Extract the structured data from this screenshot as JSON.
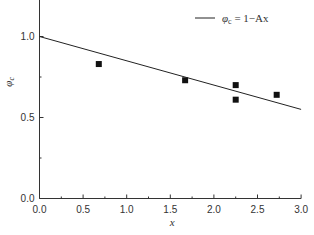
{
  "chart_data": {
    "type": "scatter",
    "title": "",
    "xlabel": "x",
    "ylabel": "φc",
    "xlim": [
      0.0,
      3.0
    ],
    "ylim": [
      0.0,
      1.2
    ],
    "xticks": [
      "0.0",
      "0.5",
      "1.0",
      "1.5",
      "2.0",
      "2.5",
      "3.0"
    ],
    "yticks": [
      "0.0",
      "0.5",
      "1.0"
    ],
    "grid": false,
    "legend_position": "top-right",
    "series": [
      {
        "name": "data",
        "type": "scatter",
        "marker": "square",
        "x": [
          0.68,
          1.67,
          2.25,
          2.25,
          2.72
        ],
        "y": [
          0.83,
          0.73,
          0.7,
          0.61,
          0.64
        ]
      },
      {
        "name": "φc = 1−Ax",
        "type": "line",
        "x": [
          0.0,
          3.0
        ],
        "y": [
          1.0,
          0.55
        ]
      }
    ]
  },
  "legend": {
    "label_main": "φ",
    "label_sub": "c",
    "label_rest": " = 1−Ax"
  },
  "axes": {
    "xlabel": "x",
    "ylabel_main": "φ",
    "ylabel_sub": "c"
  }
}
